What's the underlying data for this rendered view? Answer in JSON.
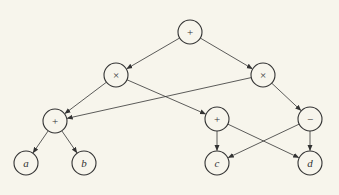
{
  "diagram": {
    "colors": {
      "background": "#f7f5ec",
      "stroke": "#333333",
      "node_fill": "#f7f5ec"
    },
    "node_radius": 12,
    "nodes": [
      {
        "id": "root",
        "label": "+",
        "x": 190,
        "y": 32,
        "kind": "operator"
      },
      {
        "id": "mulL",
        "label": "×",
        "x": 116,
        "y": 75,
        "kind": "operator"
      },
      {
        "id": "mulR",
        "label": "×",
        "x": 263,
        "y": 75,
        "kind": "operator"
      },
      {
        "id": "addL",
        "label": "+",
        "x": 55,
        "y": 121,
        "kind": "operator"
      },
      {
        "id": "addM",
        "label": "+",
        "x": 217,
        "y": 119,
        "kind": "operator"
      },
      {
        "id": "sub",
        "label": "−",
        "x": 310,
        "y": 119,
        "kind": "operator"
      },
      {
        "id": "a",
        "label": "a",
        "x": 26,
        "y": 163,
        "kind": "leaf"
      },
      {
        "id": "b",
        "label": "b",
        "x": 84,
        "y": 163,
        "kind": "leaf"
      },
      {
        "id": "c",
        "label": "c",
        "x": 217,
        "y": 163,
        "kind": "leaf"
      },
      {
        "id": "d",
        "label": "d",
        "x": 310,
        "y": 163,
        "kind": "leaf"
      }
    ],
    "edges": [
      {
        "from": "root",
        "to": "mulL"
      },
      {
        "from": "root",
        "to": "mulR"
      },
      {
        "from": "mulL",
        "to": "addL"
      },
      {
        "from": "mulL",
        "to": "addM"
      },
      {
        "from": "mulR",
        "to": "addL"
      },
      {
        "from": "mulR",
        "to": "sub"
      },
      {
        "from": "addL",
        "to": "a"
      },
      {
        "from": "addL",
        "to": "b"
      },
      {
        "from": "addM",
        "to": "c"
      },
      {
        "from": "addM",
        "to": "d"
      },
      {
        "from": "sub",
        "to": "c"
      },
      {
        "from": "sub",
        "to": "d"
      }
    ]
  }
}
